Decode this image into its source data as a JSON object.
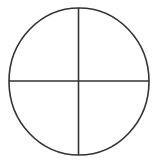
{
  "diagram": {
    "type": "circle-quadrants",
    "stroke_color": "#333333",
    "background": "#ffffff",
    "circle": {
      "cx": 79,
      "cy": 81.5,
      "rx": 70,
      "ry": 73.5
    },
    "vertical_divider": {
      "x": 78.5,
      "y1": 8,
      "y2": 155
    },
    "horizontal_divider": {
      "y": 81,
      "x1": 9,
      "x2": 149
    }
  }
}
